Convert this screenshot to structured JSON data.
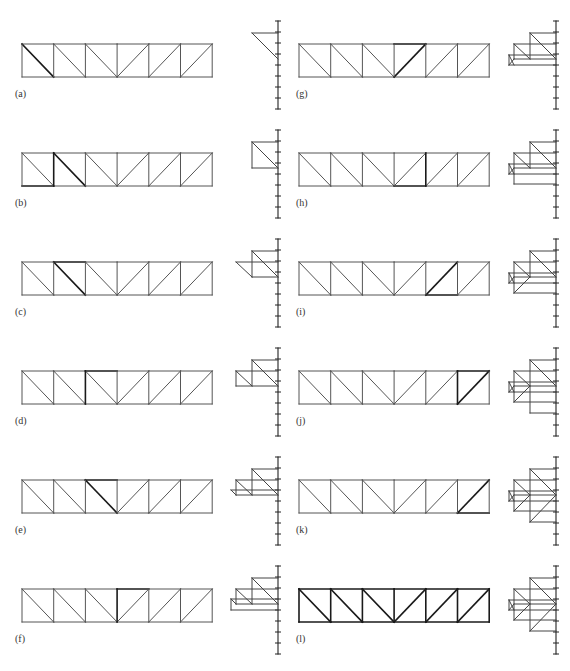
{
  "figure": {
    "colors": {
      "member": "#555555",
      "bold_member": "#1a1a1a",
      "force_line": "#444444",
      "load_line": "#222222",
      "label": "#333333"
    },
    "truss": {
      "panels": 6,
      "panel_width": 31.7,
      "height": 33,
      "diagonals": [
        "down",
        "down",
        "down",
        "up",
        "up",
        "up"
      ]
    },
    "load_line": {
      "ticks": 8,
      "tick_spacing": 11,
      "top_offset": -23
    },
    "columns": [
      {
        "truss_x": 22,
        "label_x": 15,
        "load_x": 278
      },
      {
        "truss_x": 299,
        "label_x": 296,
        "load_x": 556
      }
    ],
    "rows_top_y": [
      44,
      153,
      262,
      371,
      480,
      589
    ],
    "panels": [
      {
        "label": "(a)",
        "col": 0,
        "row": 0,
        "bold": [
          [
            "diag",
            0
          ]
        ],
        "force_lines": [
          [
            252,
            33,
            278,
            33
          ],
          [
            252,
            33,
            278,
            59
          ]
        ]
      },
      {
        "label": "(b)",
        "col": 0,
        "row": 1,
        "bold": [
          [
            "bot",
            0
          ],
          [
            "vert",
            1
          ],
          [
            "diag",
            1
          ]
        ],
        "force_lines": [
          [
            252,
            142,
            278,
            142
          ],
          [
            252,
            142,
            278,
            168
          ],
          [
            252,
            142,
            252,
            168
          ],
          [
            252,
            168,
            278,
            168
          ]
        ]
      },
      {
        "label": "(c)",
        "col": 0,
        "row": 2,
        "bold": [
          [
            "top",
            1
          ],
          [
            "diag",
            1
          ]
        ],
        "force_lines": [
          [
            252,
            251,
            278,
            251
          ],
          [
            252,
            251,
            278,
            277
          ],
          [
            252,
            251,
            252,
            277
          ],
          [
            252,
            277,
            278,
            277
          ],
          [
            236,
            262,
            278,
            262
          ],
          [
            236,
            262,
            252,
            277
          ]
        ]
      },
      {
        "label": "(d)",
        "col": 0,
        "row": 3,
        "bold": [
          [
            "vert",
            2
          ],
          [
            "top",
            2
          ]
        ],
        "force_lines": [
          [
            252,
            360,
            278,
            360
          ],
          [
            252,
            360,
            278,
            386
          ],
          [
            252,
            360,
            252,
            386
          ],
          [
            236,
            386,
            278,
            386
          ],
          [
            236,
            371,
            278,
            371
          ],
          [
            236,
            371,
            252,
            386
          ],
          [
            236,
            371,
            236,
            386
          ]
        ]
      },
      {
        "label": "(e)",
        "col": 0,
        "row": 4,
        "bold": [
          [
            "top",
            2
          ],
          [
            "diag",
            2
          ]
        ],
        "force_lines": [
          [
            252,
            469,
            278,
            469
          ],
          [
            252,
            469,
            278,
            495
          ],
          [
            252,
            469,
            252,
            495
          ],
          [
            236,
            495,
            278,
            495
          ],
          [
            236,
            480,
            278,
            480
          ],
          [
            236,
            480,
            252,
            495
          ],
          [
            236,
            480,
            236,
            495
          ],
          [
            231,
            490,
            278,
            490
          ],
          [
            231,
            490,
            236,
            495
          ]
        ]
      },
      {
        "label": "(f)",
        "col": 0,
        "row": 5,
        "bold": [
          [
            "vert",
            3
          ],
          [
            "top",
            3
          ]
        ],
        "force_lines": [
          [
            252,
            578,
            278,
            578
          ],
          [
            252,
            578,
            278,
            604
          ],
          [
            252,
            578,
            252,
            604
          ],
          [
            236,
            604,
            278,
            604
          ],
          [
            236,
            589,
            278,
            589
          ],
          [
            236,
            589,
            252,
            604
          ],
          [
            236,
            589,
            236,
            604
          ],
          [
            231,
            599,
            278,
            599
          ],
          [
            231,
            599,
            236,
            604
          ],
          [
            231,
            599,
            231,
            610
          ],
          [
            231,
            610,
            278,
            610
          ]
        ]
      },
      {
        "label": "(g)",
        "col": 1,
        "row": 0,
        "bold": [
          [
            "diag",
            3
          ],
          [
            "top",
            3
          ]
        ],
        "force_lines": [
          [
            530,
            33,
            556,
            33
          ],
          [
            530,
            33,
            556,
            59
          ],
          [
            530,
            33,
            530,
            59
          ],
          [
            514,
            59,
            556,
            59
          ],
          [
            514,
            44,
            556,
            44
          ],
          [
            514,
            44,
            530,
            59
          ],
          [
            514,
            44,
            514,
            59
          ],
          [
            509,
            55,
            556,
            55
          ],
          [
            509,
            55,
            514,
            65
          ],
          [
            509,
            55,
            509,
            65
          ],
          [
            509,
            65,
            556,
            65
          ],
          [
            509,
            65,
            514,
            59
          ]
        ]
      },
      {
        "label": "(h)",
        "col": 1,
        "row": 1,
        "bold": [
          [
            "vert",
            4
          ],
          [
            "bot",
            3
          ]
        ],
        "force_lines": [
          [
            530,
            142,
            556,
            142
          ],
          [
            530,
            142,
            556,
            168
          ],
          [
            530,
            142,
            530,
            168
          ],
          [
            514,
            168,
            556,
            168
          ],
          [
            514,
            153,
            556,
            153
          ],
          [
            514,
            153,
            530,
            168
          ],
          [
            514,
            153,
            514,
            184
          ],
          [
            509,
            164,
            556,
            164
          ],
          [
            509,
            164,
            514,
            174
          ],
          [
            509,
            164,
            509,
            174
          ],
          [
            509,
            174,
            556,
            174
          ],
          [
            509,
            174,
            514,
            168
          ],
          [
            514,
            184,
            556,
            184
          ]
        ]
      },
      {
        "label": "(i)",
        "col": 1,
        "row": 2,
        "bold": [
          [
            "diag",
            4
          ],
          [
            "bot",
            4
          ]
        ],
        "force_lines": [
          [
            530,
            251,
            556,
            251
          ],
          [
            530,
            251,
            556,
            277
          ],
          [
            530,
            251,
            530,
            277
          ],
          [
            514,
            277,
            556,
            277
          ],
          [
            514,
            262,
            556,
            262
          ],
          [
            514,
            262,
            530,
            277
          ],
          [
            514,
            262,
            514,
            293
          ],
          [
            509,
            273,
            556,
            273
          ],
          [
            509,
            273,
            514,
            283
          ],
          [
            509,
            273,
            509,
            283
          ],
          [
            509,
            283,
            556,
            283
          ],
          [
            509,
            283,
            514,
            277
          ],
          [
            514,
            293,
            556,
            293
          ],
          [
            514,
            293,
            530,
            277
          ]
        ]
      },
      {
        "label": "(j)",
        "col": 1,
        "row": 3,
        "bold": [
          [
            "vert",
            5
          ],
          [
            "top",
            5
          ],
          [
            "diag",
            5
          ]
        ],
        "force_lines": [
          [
            530,
            360,
            556,
            360
          ],
          [
            530,
            360,
            556,
            386
          ],
          [
            530,
            360,
            530,
            413
          ],
          [
            514,
            386,
            556,
            386
          ],
          [
            514,
            371,
            556,
            371
          ],
          [
            514,
            371,
            530,
            386
          ],
          [
            514,
            371,
            514,
            402
          ],
          [
            509,
            382,
            556,
            382
          ],
          [
            509,
            382,
            514,
            392
          ],
          [
            509,
            382,
            509,
            392
          ],
          [
            509,
            392,
            556,
            392
          ],
          [
            509,
            392,
            514,
            386
          ],
          [
            514,
            402,
            556,
            402
          ],
          [
            514,
            402,
            530,
            386
          ],
          [
            530,
            413,
            556,
            413
          ]
        ]
      },
      {
        "label": "(k)",
        "col": 1,
        "row": 4,
        "bold": [
          [
            "diag",
            5
          ],
          [
            "bot",
            5
          ]
        ],
        "force_lines": [
          [
            530,
            469,
            556,
            469
          ],
          [
            530,
            469,
            556,
            495
          ],
          [
            530,
            469,
            530,
            522
          ],
          [
            514,
            495,
            556,
            495
          ],
          [
            514,
            480,
            556,
            480
          ],
          [
            514,
            480,
            530,
            495
          ],
          [
            514,
            480,
            514,
            511
          ],
          [
            509,
            491,
            556,
            491
          ],
          [
            509,
            491,
            514,
            501
          ],
          [
            509,
            491,
            509,
            501
          ],
          [
            509,
            501,
            556,
            501
          ],
          [
            509,
            501,
            514,
            495
          ],
          [
            514,
            511,
            556,
            511
          ],
          [
            514,
            511,
            530,
            495
          ],
          [
            530,
            522,
            556,
            522
          ],
          [
            530,
            522,
            556,
            495
          ]
        ]
      },
      {
        "label": "(l)",
        "col": 1,
        "row": 5,
        "bold": [
          "all"
        ],
        "force_lines": [
          [
            530,
            578,
            556,
            578
          ],
          [
            530,
            578,
            556,
            604
          ],
          [
            530,
            578,
            530,
            631
          ],
          [
            514,
            604,
            556,
            604
          ],
          [
            514,
            589,
            556,
            589
          ],
          [
            514,
            589,
            530,
            604
          ],
          [
            514,
            589,
            514,
            620
          ],
          [
            509,
            600,
            556,
            600
          ],
          [
            509,
            600,
            514,
            610
          ],
          [
            509,
            600,
            509,
            610
          ],
          [
            509,
            610,
            556,
            610
          ],
          [
            509,
            610,
            514,
            604
          ],
          [
            514,
            620,
            556,
            620
          ],
          [
            514,
            620,
            530,
            604
          ],
          [
            530,
            631,
            556,
            631
          ],
          [
            530,
            631,
            556,
            604
          ]
        ]
      }
    ]
  }
}
